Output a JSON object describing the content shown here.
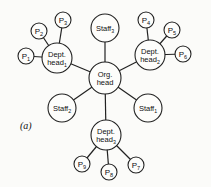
{
  "diagram": {
    "caption": "(a)",
    "center": {
      "id": "org",
      "line1": "Org.",
      "line2": "head",
      "x": 105,
      "y": 78,
      "r": 16
    },
    "nodes": [
      {
        "id": "dh1",
        "line1": "Dept.",
        "line2": "head",
        "sub": "1",
        "x": 57,
        "y": 58,
        "r": 15
      },
      {
        "id": "dh2",
        "line1": "Dept.",
        "line2": "head",
        "sub": "2",
        "x": 150,
        "y": 55,
        "r": 15
      },
      {
        "id": "dh3",
        "line1": "Dept.",
        "line2": "head",
        "sub": "3",
        "x": 106,
        "y": 135,
        "r": 15
      },
      {
        "id": "s3",
        "line1": "Staff",
        "sub": "3",
        "x": 105,
        "y": 28,
        "r": 14
      },
      {
        "id": "s2",
        "line1": "Staff",
        "sub": "2",
        "x": 62,
        "y": 108,
        "r": 14
      },
      {
        "id": "s1",
        "line1": "Staff",
        "sub": "1",
        "x": 148,
        "y": 108,
        "r": 14
      },
      {
        "id": "p1",
        "line1": "P",
        "sub": "1",
        "x": 26,
        "y": 56,
        "r": 8
      },
      {
        "id": "p2",
        "line1": "P",
        "sub": "2",
        "x": 39,
        "y": 31,
        "r": 8
      },
      {
        "id": "p3",
        "line1": "P",
        "sub": "3",
        "x": 63,
        "y": 20,
        "r": 8
      },
      {
        "id": "p4",
        "line1": "P",
        "sub": "4",
        "x": 146,
        "y": 20,
        "r": 8
      },
      {
        "id": "p5",
        "line1": "P",
        "sub": "5",
        "x": 172,
        "y": 30,
        "r": 8
      },
      {
        "id": "p6",
        "line1": "P",
        "sub": "6",
        "x": 183,
        "y": 54,
        "r": 8
      },
      {
        "id": "p7",
        "line1": "P",
        "sub": "7",
        "x": 136,
        "y": 165,
        "r": 8
      },
      {
        "id": "p8",
        "line1": "P",
        "sub": "8",
        "x": 109,
        "y": 172,
        "r": 8
      },
      {
        "id": "p9",
        "line1": "P",
        "sub": "9",
        "x": 82,
        "y": 164,
        "r": 8
      }
    ],
    "edges": [
      [
        "org",
        "dh1"
      ],
      [
        "org",
        "dh2"
      ],
      [
        "org",
        "dh3"
      ],
      [
        "org",
        "s1"
      ],
      [
        "org",
        "s2"
      ],
      [
        "org",
        "s3"
      ],
      [
        "dh1",
        "p1"
      ],
      [
        "dh1",
        "p2"
      ],
      [
        "dh1",
        "p3"
      ],
      [
        "dh2",
        "p4"
      ],
      [
        "dh2",
        "p5"
      ],
      [
        "dh2",
        "p6"
      ],
      [
        "dh3",
        "p7"
      ],
      [
        "dh3",
        "p8"
      ],
      [
        "dh3",
        "p9"
      ]
    ]
  }
}
